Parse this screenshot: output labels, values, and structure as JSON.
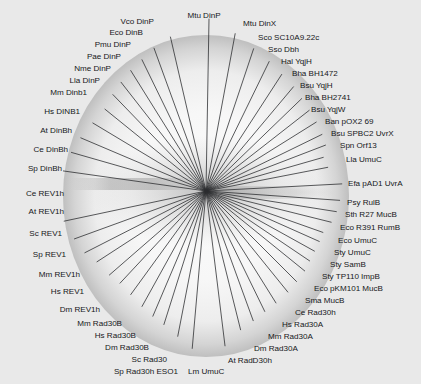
{
  "figure": {
    "kind": "radial-unrooted-phylogenetic-tree",
    "background_color": "#e9e9e9",
    "disc_fill_color": "#f6f6f6",
    "disc_shadow_color": "#9a9a9a",
    "branch_color": "#2a2c2e",
    "label_color": "#16181a",
    "center": {
      "x": 206,
      "y": 191
    },
    "disc": {
      "cx": 206,
      "cy": 196,
      "rx": 142,
      "ry": 160
    }
  },
  "chart_data": {
    "type": "tree",
    "title": "",
    "center": {
      "x": 206,
      "y": 191
    },
    "leaves": [
      {
        "label": "Mtu DinP",
        "angle_deg": -89.0,
        "branch_len": 172,
        "tx": 204,
        "ty": 16,
        "anchor": "middle"
      },
      {
        "label": "Mtu DinX",
        "angle_deg": -79.5,
        "branch_len": 160,
        "tx": 243,
        "ty": 24,
        "anchor": "start"
      },
      {
        "label": "Sco SC10A9.22c",
        "angle_deg": -71.5,
        "branch_len": 150,
        "tx": 258,
        "ty": 38,
        "anchor": "start"
      },
      {
        "label": "Sso Dbh",
        "angle_deg": -64.0,
        "branch_len": 144,
        "tx": 268,
        "ty": 50,
        "anchor": "start"
      },
      {
        "label": "Hal YqjH",
        "angle_deg": -57.0,
        "branch_len": 139,
        "tx": 281,
        "ty": 62,
        "anchor": "start"
      },
      {
        "label": "Bha BH1472",
        "angle_deg": -50.0,
        "branch_len": 136,
        "tx": 292,
        "ty": 74,
        "anchor": "start"
      },
      {
        "label": "Bsu YqjH",
        "angle_deg": -44.0,
        "branch_len": 133,
        "tx": 300,
        "ty": 86,
        "anchor": "start"
      },
      {
        "label": "Bha BH2741",
        "angle_deg": -38.0,
        "branch_len": 131,
        "tx": 305,
        "ty": 98,
        "anchor": "start"
      },
      {
        "label": "Bsu YqjW",
        "angle_deg": -32.0,
        "branch_len": 130,
        "tx": 311,
        "ty": 110,
        "anchor": "start"
      },
      {
        "label": "Ban pOX2 69",
        "angle_deg": -26.0,
        "branch_len": 129,
        "tx": 325,
        "ty": 122,
        "anchor": "start"
      },
      {
        "label": "Bsu SPBC2 UvrX",
        "angle_deg": -21.0,
        "branch_len": 128,
        "tx": 331,
        "ty": 134,
        "anchor": "start"
      },
      {
        "label": "Spn Orf13",
        "angle_deg": -16.0,
        "branch_len": 122,
        "tx": 340,
        "ty": 146,
        "anchor": "start"
      },
      {
        "label": "Lla UmuC",
        "angle_deg": -11.0,
        "branch_len": 124,
        "tx": 346,
        "ty": 160,
        "anchor": "start"
      },
      {
        "label": "Efa pAD1 UvrA",
        "angle_deg": -3.0,
        "branch_len": 136,
        "tx": 348,
        "ty": 184,
        "anchor": "start"
      },
      {
        "label": "Psy RulB",
        "angle_deg": 4.0,
        "branch_len": 134,
        "tx": 347,
        "ty": 203,
        "anchor": "start"
      },
      {
        "label": "Sth R27 MucB",
        "angle_deg": 9.0,
        "branch_len": 132,
        "tx": 345,
        "ty": 215,
        "anchor": "start"
      },
      {
        "label": "Eco R391 RumB",
        "angle_deg": 14.0,
        "branch_len": 129,
        "tx": 340,
        "ty": 228,
        "anchor": "start"
      },
      {
        "label": "Eco UmuC",
        "angle_deg": 19.5,
        "branch_len": 124,
        "tx": 338,
        "ty": 241,
        "anchor": "start"
      },
      {
        "label": "Sty UmuC",
        "angle_deg": 24.0,
        "branch_len": 124,
        "tx": 334,
        "ty": 253,
        "anchor": "start"
      },
      {
        "label": "Sty SamB",
        "angle_deg": 29.0,
        "branch_len": 124,
        "tx": 330,
        "ty": 265,
        "anchor": "start"
      },
      {
        "label": "Sty TP110 ImpB",
        "angle_deg": 34.0,
        "branch_len": 125,
        "tx": 322,
        "ty": 277,
        "anchor": "start"
      },
      {
        "label": "Eco pKM101 MucB",
        "angle_deg": 39.0,
        "branch_len": 127,
        "tx": 314,
        "ty": 289,
        "anchor": "start"
      },
      {
        "label": "Sma MucB",
        "angle_deg": 45.0,
        "branch_len": 128,
        "tx": 305,
        "ty": 301,
        "anchor": "start"
      },
      {
        "label": "Ce Rad30h",
        "angle_deg": 51.0,
        "branch_len": 130,
        "tx": 295,
        "ty": 313,
        "anchor": "start"
      },
      {
        "label": "Hs Rad30A",
        "angle_deg": 58.0,
        "branch_len": 132,
        "tx": 282,
        "ty": 325,
        "anchor": "start"
      },
      {
        "label": "Mm Rad30A",
        "angle_deg": 64.0,
        "branch_len": 134,
        "tx": 268,
        "ty": 337,
        "anchor": "start"
      },
      {
        "label": "Dm Rad30A",
        "angle_deg": 70.0,
        "branch_len": 138,
        "tx": 254,
        "ty": 349,
        "anchor": "start"
      },
      {
        "label": "At RadD30h",
        "angle_deg": 76.0,
        "branch_len": 143,
        "tx": 228,
        "ty": 361,
        "anchor": "start"
      },
      {
        "label": "Lm UmuC",
        "angle_deg": 83.0,
        "branch_len": 156,
        "tx": 188,
        "ty": 372,
        "anchor": "start"
      },
      {
        "label": "Sp Rad30h ESO1",
        "angle_deg": 95.0,
        "branch_len": 158,
        "tx": 178,
        "ty": 372,
        "anchor": "end"
      },
      {
        "label": "Sc Rad30",
        "angle_deg": 101.0,
        "branch_len": 148,
        "tx": 167,
        "ty": 360,
        "anchor": "end"
      },
      {
        "label": "Dm Rad30B",
        "angle_deg": 107.5,
        "branch_len": 140,
        "tx": 149,
        "ty": 348,
        "anchor": "end"
      },
      {
        "label": "Hs Rad30B",
        "angle_deg": 113.0,
        "branch_len": 136,
        "tx": 136,
        "ty": 336,
        "anchor": "end"
      },
      {
        "label": "Mm Rad30B",
        "angle_deg": 119.0,
        "branch_len": 132,
        "tx": 122,
        "ty": 324,
        "anchor": "end"
      },
      {
        "label": "Dm REV1h",
        "angle_deg": 126.0,
        "branch_len": 128,
        "tx": 100,
        "ty": 310,
        "anchor": "end"
      },
      {
        "label": "Hs REV1",
        "angle_deg": 133.0,
        "branch_len": 126,
        "tx": 84,
        "ty": 292,
        "anchor": "end"
      },
      {
        "label": "Mm REV1h",
        "angle_deg": 139.0,
        "branch_len": 128,
        "tx": 80,
        "ty": 275,
        "anchor": "end"
      },
      {
        "label": "Sp REV1",
        "angle_deg": 147.0,
        "branch_len": 130,
        "tx": 66,
        "ty": 255,
        "anchor": "end"
      },
      {
        "label": "Sc REV1",
        "angle_deg": 153.0,
        "branch_len": 136,
        "tx": 62,
        "ty": 234,
        "anchor": "end"
      },
      {
        "label": "At REV1h",
        "angle_deg": 160.0,
        "branch_len": 140,
        "tx": 64,
        "ty": 212,
        "anchor": "end"
      },
      {
        "label": "Ce REV1h",
        "angle_deg": 168.0,
        "branch_len": 145,
        "tx": 64,
        "ty": 194,
        "anchor": "end"
      },
      {
        "label": "Sp DinBh",
        "angle_deg": 188.0,
        "branch_len": 144,
        "tx": 62,
        "ty": 169,
        "anchor": "end"
      },
      {
        "label": "Ce DinBh",
        "angle_deg": 196.0,
        "branch_len": 140,
        "tx": 68,
        "ty": 150,
        "anchor": "end"
      },
      {
        "label": "At DinBh",
        "angle_deg": 203.0,
        "branch_len": 136,
        "tx": 72,
        "ty": 131,
        "anchor": "end"
      },
      {
        "label": "Hs DINB1",
        "angle_deg": 211.0,
        "branch_len": 132,
        "tx": 80,
        "ty": 112,
        "anchor": "end"
      },
      {
        "label": "Mm Dinb1",
        "angle_deg": 219.0,
        "branch_len": 130,
        "tx": 87,
        "ty": 93,
        "anchor": "end"
      },
      {
        "label": "Lla DinP",
        "angle_deg": 226.0,
        "branch_len": 134,
        "tx": 100,
        "ty": 81,
        "anchor": "end"
      },
      {
        "label": "Nme DinP",
        "angle_deg": 232.0,
        "branch_len": 138,
        "tx": 111,
        "ty": 69,
        "anchor": "end"
      },
      {
        "label": "Pae DinP",
        "angle_deg": 238.0,
        "branch_len": 142,
        "tx": 121,
        "ty": 57,
        "anchor": "end"
      },
      {
        "label": "Pmu DinP",
        "angle_deg": 244.0,
        "branch_len": 146,
        "tx": 131,
        "ty": 45,
        "anchor": "end"
      },
      {
        "label": "Eco DinB",
        "angle_deg": 250.0,
        "branch_len": 152,
        "tx": 143,
        "ty": 33,
        "anchor": "end"
      },
      {
        "label": "Vco DinP",
        "angle_deg": 257.0,
        "branch_len": 158,
        "tx": 154,
        "ty": 22,
        "anchor": "end"
      }
    ],
    "leaf_count": 52
  }
}
